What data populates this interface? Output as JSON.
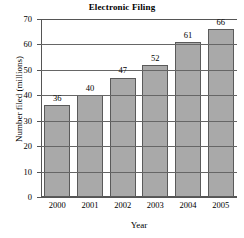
{
  "chart_data": {
    "type": "bar",
    "title": "Electronic Filing",
    "xlabel": "Year",
    "ylabel": "Number filed (millions)",
    "categories": [
      "2000",
      "2001",
      "2002",
      "2003",
      "2004",
      "2005"
    ],
    "values": [
      36,
      40,
      47,
      52,
      61,
      66
    ],
    "value_labels": [
      "36",
      "40",
      "47",
      "52",
      "61",
      "66"
    ],
    "ylim": [
      0,
      70
    ],
    "ytick_values": [
      0,
      10,
      20,
      30,
      40,
      50,
      60,
      70
    ],
    "ytick_labels": [
      "0",
      "10",
      "20",
      "30",
      "40",
      "50",
      "60",
      "70"
    ],
    "grid": true,
    "grid_axis": "y",
    "legend": null,
    "series": [
      {
        "name": "Number filed (millions)",
        "values": [
          36,
          40,
          47,
          52,
          61,
          66
        ]
      }
    ],
    "colors": {
      "bar_fill": "#a9a9a9",
      "bar_edge": "#5a5a5a",
      "axis": "#555555",
      "grid": "#666666",
      "text": "#000000",
      "background": "#ffffff"
    }
  }
}
